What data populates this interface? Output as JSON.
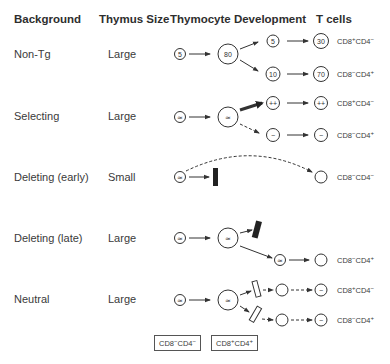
{
  "headers": {
    "background": "Background",
    "thymus_size": "Thymus Size",
    "development": "Thymocyte Development",
    "tcells": "T cells"
  },
  "rows": [
    {
      "background": "Non-Tg",
      "thymus_size": "Large",
      "nodes": {
        "dn": "5",
        "dp": "80",
        "sp_cd8": "5",
        "sp_cd4": "10",
        "t_cd8": "30",
        "t_cd4": "70"
      },
      "tcell_labels": [
        {
          "cd8": "+",
          "cd4": "−"
        },
        {
          "cd8": "−",
          "cd4": "+"
        }
      ]
    },
    {
      "background": "Selecting",
      "thymus_size": "Large",
      "nodes": {
        "dn": "≃",
        "dp": "≃",
        "sp_cd8": "++",
        "sp_cd4": "−",
        "t_cd8": "++",
        "t_cd4": "−"
      },
      "tcell_labels": [
        {
          "cd8": "+",
          "cd4": "−"
        },
        {
          "cd8": "−",
          "cd4": "+"
        }
      ]
    },
    {
      "background": "Deleting (early)",
      "thymus_size": "Small",
      "nodes": {
        "dn": "≃"
      },
      "tcell_labels": [
        {
          "cd8": "−",
          "cd4": "−"
        }
      ]
    },
    {
      "background": "Deleting (late)",
      "thymus_size": "Large",
      "nodes": {
        "dn": "≃",
        "dp": "≃",
        "sp_cd4": "≃"
      },
      "tcell_labels": [
        {
          "cd8": "−",
          "cd4": "+"
        }
      ]
    },
    {
      "background": "Neutral",
      "thymus_size": "Large",
      "nodes": {
        "dn": "≃",
        "dp": "≃",
        "t_cd8": "−",
        "t_cd4": "−"
      },
      "tcell_labels": [
        {
          "cd8": "+",
          "cd4": "−"
        },
        {
          "cd8": "−",
          "cd4": "+"
        }
      ]
    }
  ],
  "legend": [
    {
      "cd8": "−",
      "cd4": "−"
    },
    {
      "cd8": "+",
      "cd4": "+"
    }
  ]
}
